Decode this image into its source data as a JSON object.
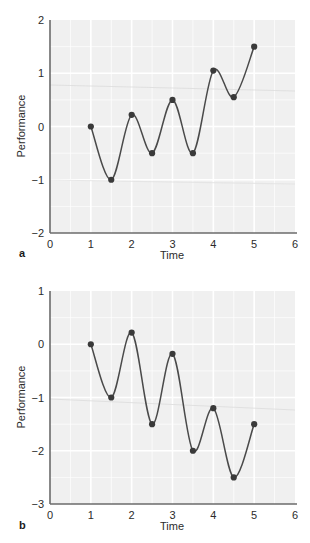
{
  "figure": {
    "panels": [
      {
        "letter": "a",
        "chart_data": {
          "type": "line",
          "title": "",
          "xlabel": "Time",
          "ylabel": "Performance",
          "xlim": [
            0,
            6
          ],
          "ylim": [
            -2,
            2
          ],
          "xticks": [
            0,
            1,
            2,
            3,
            4,
            5,
            6
          ],
          "xtick_labels": [
            "0",
            "1",
            "2",
            "3",
            "4",
            "5",
            "6"
          ],
          "yticks": [
            -2,
            -1,
            0,
            1,
            2
          ],
          "ytick_labels": [
            "-2",
            "-1",
            "0",
            "1",
            "2"
          ],
          "grid": true,
          "legend": "none",
          "series": [
            {
              "name": "Performance",
              "x": [
                1,
                1.5,
                2,
                2.5,
                3,
                3.5,
                4,
                4.5,
                5
              ],
              "values": [
                0,
                -1,
                0.22,
                -0.5,
                0.5,
                -0.5,
                1.05,
                0.55,
                1.5
              ],
              "marker": "filled-circle",
              "line_color": "#4a4a4a",
              "marker_color": "#3a3a3a"
            }
          ],
          "annotation": "Oscillating performance with an upward overall trend"
        }
      },
      {
        "letter": "b",
        "chart_data": {
          "type": "line",
          "title": "",
          "xlabel": "Time",
          "ylabel": "Performance",
          "xlim": [
            0,
            6
          ],
          "ylim": [
            -3,
            1
          ],
          "xticks": [
            0,
            1,
            2,
            3,
            4,
            5,
            6
          ],
          "xtick_labels": [
            "0",
            "1",
            "2",
            "3",
            "4",
            "5",
            "6"
          ],
          "yticks": [
            -3,
            -2,
            -1,
            0,
            1
          ],
          "ytick_labels": [
            "-3",
            "-2",
            "-1",
            "0",
            "1"
          ],
          "grid": true,
          "legend": "none",
          "series": [
            {
              "name": "Performance",
              "x": [
                1,
                1.5,
                2,
                2.5,
                3,
                3.5,
                4,
                4.5,
                5
              ],
              "values": [
                0,
                -1,
                0.22,
                -1.5,
                -0.18,
                -2.0,
                -1.2,
                -2.5,
                -1.5
              ],
              "marker": "filled-circle",
              "line_color": "#4a4a4a",
              "marker_color": "#3a3a3a"
            }
          ],
          "annotation": "Oscillating performance with a downward overall trend"
        }
      }
    ],
    "style": {
      "plot_background": "#f0f0f0",
      "grid_color": "#ffffff",
      "axis_color": "#6b6b6b",
      "page_background": "#ffffff"
    }
  }
}
